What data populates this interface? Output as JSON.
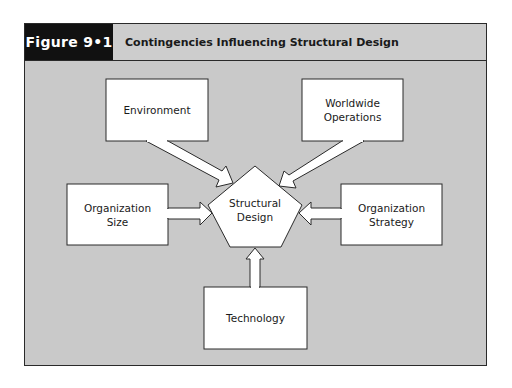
{
  "figure": {
    "label": "Figure 9•1",
    "title": "Contingencies Influencing Structural Design"
  },
  "diagram": {
    "center": {
      "label": "Structural\nDesign",
      "shape": "pentagon"
    },
    "factors": [
      {
        "id": "environment",
        "label": "Environment",
        "position": "top-left"
      },
      {
        "id": "worldwide-operations",
        "label": "Worldwide\nOperations",
        "position": "top-right"
      },
      {
        "id": "organization-size",
        "label": "Organization\nSize",
        "position": "left"
      },
      {
        "id": "organization-strategy",
        "label": "Organization\nStrategy",
        "position": "right"
      },
      {
        "id": "technology",
        "label": "Technology",
        "position": "bottom"
      }
    ],
    "edges": [
      {
        "from": "environment",
        "to": "center"
      },
      {
        "from": "worldwide-operations",
        "to": "center"
      },
      {
        "from": "organization-size",
        "to": "center"
      },
      {
        "from": "organization-strategy",
        "to": "center"
      },
      {
        "from": "technology",
        "to": "center"
      }
    ],
    "colors": {
      "background": "#c9c9c9",
      "node_fill": "#ffffff",
      "stroke": "#2a2a2a",
      "header_label_bg": "#111111"
    }
  }
}
